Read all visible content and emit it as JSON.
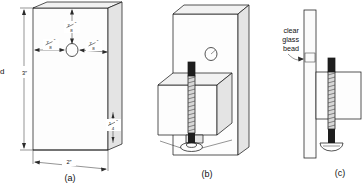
{
  "figure": {
    "background_color": "#ffffff",
    "line_color": "#1b1b1b",
    "width": 363,
    "height": 186
  },
  "panels": [
    {
      "id": "a",
      "label": "(a)",
      "caption": "Board with drilled center hole",
      "dimensions": [
        {
          "name": "top-offset",
          "whole": "",
          "numerator": "7",
          "denominator": "8",
          "unit": "″",
          "text": "7/8″"
        },
        {
          "name": "left-offset",
          "whole": "",
          "numerator": "7",
          "denominator": "8",
          "unit": "″",
          "text": "7/8″"
        },
        {
          "name": "right-offset",
          "whole": "",
          "numerator": "7",
          "denominator": "8",
          "unit": "″",
          "text": "7/8″"
        },
        {
          "name": "height",
          "whole": "3",
          "numerator": "",
          "denominator": "",
          "unit": "″",
          "text": "3″"
        },
        {
          "name": "width",
          "whole": "2",
          "numerator": "",
          "denominator": "",
          "unit": "″",
          "text": "2″"
        },
        {
          "name": "thickness",
          "whole": "",
          "numerator": "1",
          "denominator": "4",
          "unit": "″",
          "text": "1/4″"
        }
      ],
      "features": [
        "drilled-hole"
      ]
    },
    {
      "id": "b",
      "label": "(b)",
      "caption": "Block fastened to board with threaded screw",
      "features": [
        "mounting-board",
        "wood-block",
        "threaded-screw",
        "screw-head-washer",
        "hole-callout"
      ]
    },
    {
      "id": "c",
      "label": "(c)",
      "caption": "Section view with clear glass bead",
      "annotations": [
        {
          "name": "clear-glass-bead",
          "lines": [
            "clear",
            "glass",
            "bead"
          ],
          "text": "clear glass bead"
        }
      ],
      "features": [
        "side-board",
        "glass-bead",
        "block-section",
        "threaded-screw",
        "screw-head"
      ]
    }
  ],
  "edge_text": {
    "left_clipped": "d"
  }
}
